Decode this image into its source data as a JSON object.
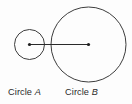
{
  "figure": {
    "type": "geometry-diagram",
    "background_color": "#fdfdfd",
    "stroke_color": "#3d3d3d",
    "segment_color": "#2a2a2a",
    "text_color": "#2b2b2b",
    "shapes": {
      "circle_a": {
        "name": "Circle A",
        "center_x": 29.5,
        "center_y": 44.5,
        "radius": 15
      },
      "circle_b": {
        "name": "Circle B",
        "center_x": 88.5,
        "center_y": 44.5,
        "radius": 37.5
      },
      "center_segment": {
        "x1": 29.5,
        "y1": 44.5,
        "x2": 88.5,
        "y2": 44.5,
        "endpoint_marker": "filled-dot",
        "endpoint_radius": 1.6
      }
    },
    "labels": {
      "circle_a": {
        "prefix": "Circle ",
        "letter": "A"
      },
      "circle_b": {
        "prefix": "Circle ",
        "letter": "B"
      }
    }
  }
}
